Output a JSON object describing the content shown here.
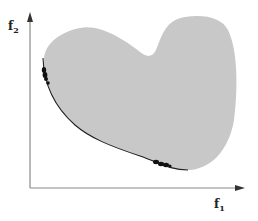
{
  "figure": {
    "x_axis": {
      "label_main": "f",
      "label_sub": "1"
    },
    "y_axis": {
      "label_main": "f",
      "label_sub": "2"
    },
    "colors": {
      "region_fill": "#c8c8c8",
      "axis": "#8a8a8a",
      "pareto_front": "#222222",
      "points": "#111111",
      "background": "#ffffff"
    },
    "elements": {
      "feasible_region": "gray blob-shaped feasible objective region",
      "pareto_front": "dark curve along lower-left boundary of region",
      "point_clusters": [
        {
          "name": "upper-left cluster",
          "location": "left boundary near top of front"
        },
        {
          "name": "lower-right cluster",
          "location": "bottom boundary near end of front"
        }
      ]
    }
  }
}
